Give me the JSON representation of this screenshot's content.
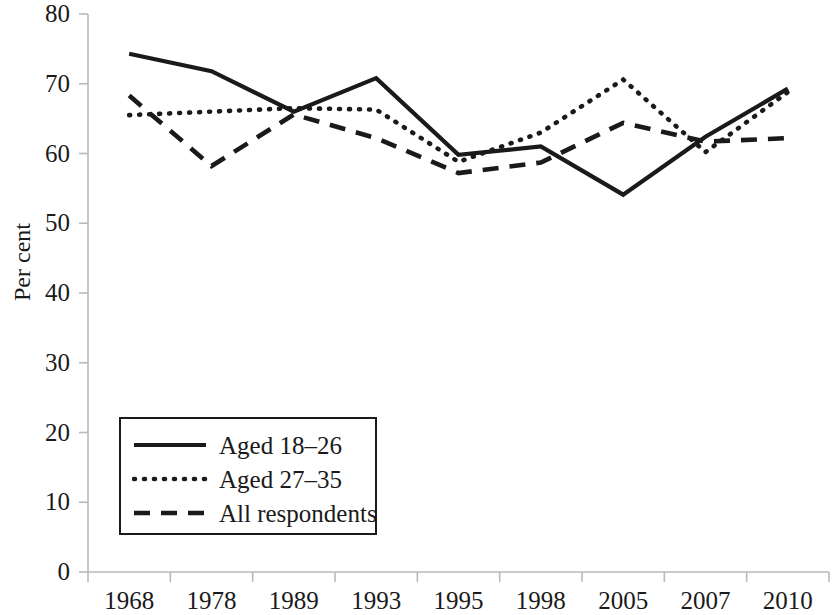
{
  "chart_data": {
    "type": "line",
    "title": "",
    "xlabel": "",
    "ylabel": "Per cent",
    "categories": [
      "1968",
      "1978",
      "1989",
      "1993",
      "1995",
      "1998",
      "2005",
      "2007",
      "2010"
    ],
    "ylim": [
      0,
      80
    ],
    "yticks": [
      0,
      10,
      20,
      30,
      40,
      50,
      60,
      70,
      80
    ],
    "ytick_labels": [
      "0",
      "10",
      "20",
      "30",
      "40",
      "50",
      "60",
      "70",
      "80"
    ],
    "grid": false,
    "legend_position": "lower-left inside plot",
    "series": [
      {
        "name": "Aged 18–26",
        "style": "solid",
        "color": "#1a1a1a",
        "values": [
          74.3,
          71.8,
          66.0,
          70.8,
          59.8,
          61.0,
          54.1,
          62.4,
          69.3
        ]
      },
      {
        "name": "Aged 27–35",
        "style": "dotted",
        "color": "#1a1a1a",
        "values": [
          65.5,
          66.0,
          66.5,
          66.3,
          58.8,
          63.0,
          70.6,
          60.2,
          68.8
        ]
      },
      {
        "name": "All respondents",
        "style": "dashed",
        "color": "#1a1a1a",
        "values": [
          68.3,
          58.2,
          65.6,
          62.2,
          57.2,
          58.7,
          64.4,
          61.7,
          62.2
        ]
      }
    ]
  },
  "axes": {
    "y_label": "Per cent"
  },
  "legend": {
    "entries": [
      {
        "label": "Aged 18–26",
        "style": "solid"
      },
      {
        "label": "Aged 27–35",
        "style": "dotted"
      },
      {
        "label": "All respondents",
        "style": "dashed"
      }
    ]
  }
}
